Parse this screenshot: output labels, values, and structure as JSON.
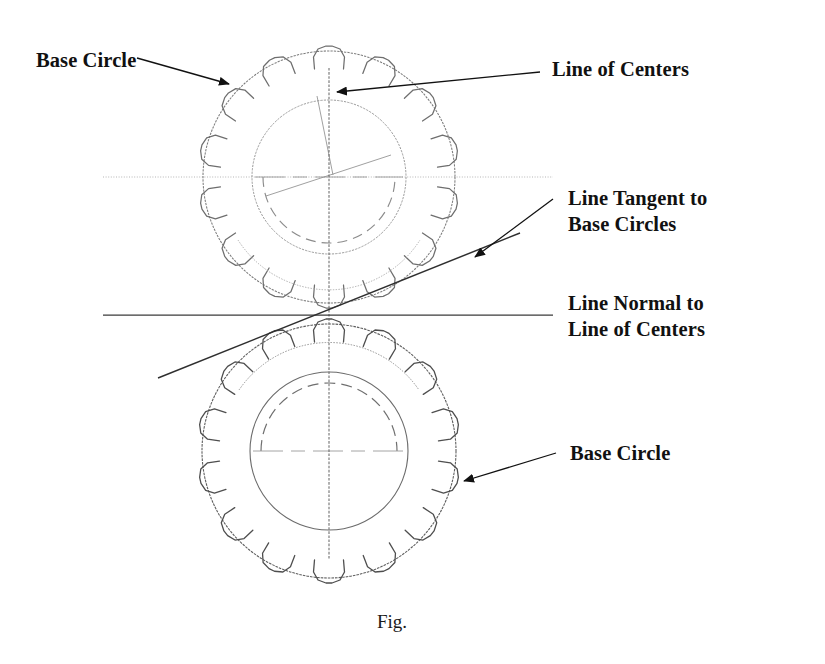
{
  "figure": {
    "caption": "Fig.",
    "background_color": "#ffffff",
    "line_color": "#2b2b2b",
    "faint_line_color": "#8a8a8a",
    "label_color": "#111111"
  },
  "labels": {
    "base_circle_top": "Base Circle",
    "line_of_centers": "Line of Centers",
    "line_tangent_to_base_circles": "Line Tangent to\nBase Circles",
    "line_normal_to_line_of_centers": "Line Normal to\nLine of Centers",
    "base_circle_bottom": "Base Circle"
  },
  "geometry": {
    "upper_gear": {
      "center_x": 329,
      "center_y": 177,
      "base_circle_radius": 126,
      "inner_circle_radius": 77,
      "dashed_arc_radius": 66,
      "teeth_count": 14,
      "tooth_tip_radius": 128,
      "tooth_root_radius": 108
    },
    "lower_gear": {
      "center_x": 329,
      "center_y": 451,
      "base_circle_radius": 127,
      "inner_circle_radius": 79,
      "dashed_arc_radius": 68,
      "teeth_count": 14,
      "tooth_tip_radius": 129,
      "tooth_root_radius": 109
    },
    "pitch_point_x": 329,
    "pitch_point_y": 315,
    "line_normal": {
      "x1": 103,
      "y1": 315,
      "x2": 553,
      "y2": 315
    },
    "line_tangent": {
      "x1": 158,
      "y1": 378,
      "x2": 520,
      "y2": 233,
      "pressure_angle_deg": 21.8
    },
    "dotted_horizontal": {
      "x1": 103,
      "y1": 177,
      "x2": 553,
      "y2": 177
    },
    "vertical_center_line": {
      "x": 329,
      "y1": 68,
      "y2": 560
    }
  },
  "leaders": {
    "base_circle_top": {
      "x1": 137,
      "y1": 58,
      "x2": 232,
      "y2": 85,
      "arrow_angle_deg": 16
    },
    "line_of_centers": {
      "x1": 540,
      "y1": 72,
      "x2": 334,
      "y2": 92,
      "arrow_angle_deg": 185
    },
    "line_tangent": {
      "x1": 553,
      "y1": 199,
      "x2": 472,
      "y2": 259,
      "arrow_angle_deg": 143
    },
    "base_circle_bottom": {
      "x1": 556,
      "y1": 453,
      "x2": 461,
      "y2": 482,
      "arrow_angle_deg": 197
    }
  }
}
